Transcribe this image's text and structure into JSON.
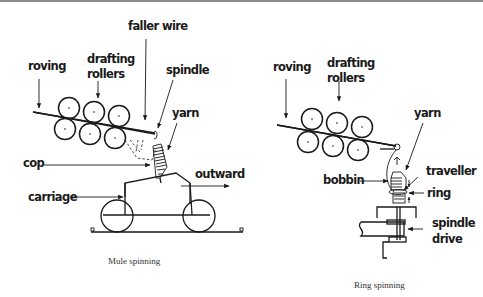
{
  "mule": {
    "caption": "Mule spinning",
    "labels": {
      "faller_wire": "faller wire",
      "roving": "roving",
      "drafting_line1": "drafting",
      "drafting_line2": "rollers",
      "spindle": "spindle",
      "yarn": "yarn",
      "cop": "cop",
      "outward": "outward",
      "carriage": "carriage"
    }
  },
  "ring": {
    "caption": "Ring spinning",
    "labels": {
      "roving": "roving",
      "drafting_line1": "drafting",
      "drafting_line2": "rollers",
      "yarn": "yarn",
      "bobbin": "bobbin",
      "traveller": "traveller",
      "ring": "ring",
      "spindle_line1": "spindle",
      "spindle_line2": "drive"
    }
  },
  "colors": {
    "ink": "#1a1a1a",
    "rule": "#8a8a8a",
    "background": "#ffffff"
  }
}
